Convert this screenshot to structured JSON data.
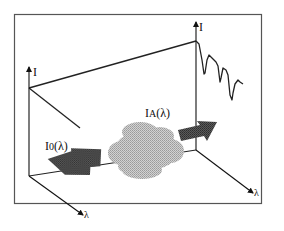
{
  "figure": {
    "labels": {
      "left_intensity_axis": "I",
      "left_wavelength_axis": "λ",
      "right_intensity_axis": "I",
      "right_wavelength_axis": "λ",
      "incident_beam": "I",
      "incident_sub": "0",
      "incident_arg": "(λ)",
      "transmitted_beam": "I",
      "transmitted_sub": "A",
      "transmitted_arg": "(λ)"
    },
    "colors": {
      "frame": "#555555",
      "lines": "#222222",
      "arrow_fill": "#4a4a4a",
      "cloud_fill": "#bdbdbd",
      "background": "#ffffff"
    },
    "elements": {
      "cloud": "absorbing-medium",
      "left_arrow": "incident-light-arrow",
      "right_arrow": "transmitted-light-arrow",
      "spectrum": "absorption-spectrum-with-dips"
    }
  }
}
